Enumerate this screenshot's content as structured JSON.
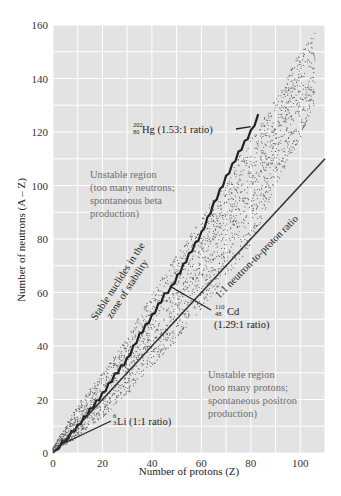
{
  "chart_data": {
    "type": "scatter",
    "title": "",
    "xlabel": "Number of protons (Z)",
    "ylabel": "Number of neutrons (A – Z)",
    "xlim": [
      0,
      110
    ],
    "ylim": [
      0,
      160
    ],
    "xticks": [
      0,
      20,
      40,
      60,
      80,
      100
    ],
    "yticks": [
      0,
      20,
      40,
      60,
      80,
      100,
      120,
      140,
      160
    ],
    "grid": true,
    "grid_minor_step": 10,
    "background": "#e3e3e3",
    "series": [
      {
        "name": "1:1 neutron-to-proton ratio",
        "type": "line",
        "x": [
          0,
          110
        ],
        "y": [
          0,
          110
        ]
      },
      {
        "name": "Stable nuclides (zone of stability)",
        "type": "step",
        "x": [
          1,
          5,
          10,
          15,
          20,
          25,
          30,
          35,
          40,
          45,
          48,
          55,
          60,
          65,
          70,
          75,
          80,
          83
        ],
        "y": [
          1,
          5,
          10,
          16,
          22,
          29,
          35,
          44,
          51,
          59,
          62,
          74,
          82,
          93,
          103,
          112,
          120,
          126
        ]
      },
      {
        "name": "Known nuclides band",
        "type": "band",
        "x": [
          0,
          10,
          20,
          30,
          40,
          50,
          60,
          70,
          80,
          90,
          100,
          106
        ],
        "lower": [
          0,
          6,
          13,
          22,
          32,
          42,
          54,
          66,
          77,
          100,
          118,
          130
        ],
        "upper": [
          2,
          18,
          30,
          43,
          60,
          74,
          88,
          103,
          118,
          132,
          150,
          157
        ]
      }
    ],
    "annotations": [
      {
        "text": "Unstable region",
        "x": 14,
        "y": 104
      },
      {
        "text": "(too many neutrons;",
        "x": 14,
        "y": 99
      },
      {
        "text": "spontaneous beta",
        "x": 14,
        "y": 94
      },
      {
        "text": "production)",
        "x": 14,
        "y": 89
      },
      {
        "text": "Unstable region",
        "x": 63,
        "y": 28
      },
      {
        "text": "(too many protons;",
        "x": 63,
        "y": 23
      },
      {
        "text": "spontaneous positron",
        "x": 63,
        "y": 18
      },
      {
        "text": "production)",
        "x": 63,
        "y": 13
      },
      {
        "text": "Stable nuclides in the",
        "x": 17,
        "y": 55,
        "rotation": -57
      },
      {
        "text": "zone of stability",
        "x": 21,
        "y": 54,
        "rotation": -57
      },
      {
        "text": "1:1 neutron-to-proton ratio",
        "x": 67,
        "y": 53,
        "rotation": -45
      },
      {
        "text": "Hg (1.53:1 ratio)",
        "mass": "202",
        "atomic": "80",
        "point": [
          80,
          122
        ],
        "label_at": [
          32,
          122
        ]
      },
      {
        "text": "Cd",
        "mass": "110",
        "atomic": "48",
        "point": [
          48,
          62
        ],
        "label_at": [
          60,
          56
        ],
        "sub": "(1.29:1 ratio)"
      },
      {
        "text": "Li (1:1 ratio)",
        "mass": "6",
        "atomic": "3",
        "point": [
          3,
          3
        ],
        "label_at": [
          25,
          8
        ]
      }
    ]
  },
  "axes": {
    "x_label": "Number of protons (Z)",
    "y_label": "Number of neutrons (A – Z)",
    "x_tick_labels": [
      "0",
      "20",
      "40",
      "60",
      "80",
      "100"
    ],
    "y_tick_labels": [
      "0",
      "20",
      "40",
      "60",
      "80",
      "100",
      "120",
      "140",
      "160"
    ]
  },
  "labels": {
    "neutron_region": [
      "Unstable region",
      "(too many neutrons;",
      "spontaneous beta",
      "production)"
    ],
    "proton_region": [
      "Unstable region",
      "(too many protons;",
      "spontaneous positron",
      "production)"
    ],
    "stability_line1": "Stable nuclides in the",
    "stability_line2": "zone of stability",
    "ratio_line": "1:1 neutron-to-proton ratio",
    "hg_mass": "202",
    "hg_atomic": "80",
    "hg_text": "Hg (1.53:1 ratio)",
    "cd_mass": "110",
    "cd_atomic": "48",
    "cd_text": "Cd",
    "cd_ratio": "(1.29:1 ratio)",
    "li_mass": "6",
    "li_atomic": "3",
    "li_text": "Li (1:1 ratio)"
  }
}
